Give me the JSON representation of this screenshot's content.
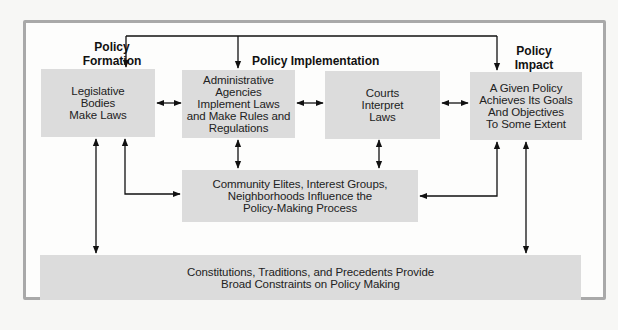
{
  "diagram": {
    "labels": {
      "formation": "Policy\nFormation",
      "implementation": "Policy Implementation",
      "impact": "Policy\nImpact"
    },
    "boxes": {
      "legislative": "Legislative\nBodies\nMake Laws",
      "administrative": "Administrative\nAgencies\nImplement Laws\nand Make Rules and\nRegulations",
      "courts": "Courts\nInterpret\nLaws",
      "impact": "A Given Policy\nAchieves Its Goals\nAnd Objectives\nTo Some Extent",
      "community": "Community Elites, Interest Groups,\nNeighborhoods Influence the\nPolicy-Making Process",
      "constitutions": "Constitutions, Traditions, and Precedents Provide\nBroad Constraints on Policy Making"
    },
    "colors": {
      "box_fill": "#dcdcdc",
      "frame_border": "#a9a9a9",
      "arrow": "#111111"
    }
  }
}
